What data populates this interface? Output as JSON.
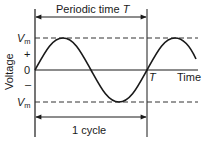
{
  "diagram": {
    "type": "sine-waveform",
    "colors": {
      "stroke": "#1a1a1a",
      "dashed": "#333333",
      "background": "#ffffff"
    },
    "labels": {
      "periodic_time": "Periodic time ",
      "periodic_time_symbol": "T",
      "one_cycle": "1 cycle",
      "vm_top_main": "V",
      "vm_top_sub": "m",
      "vm_bottom_main": "V",
      "vm_bottom_sub": "m",
      "plus": "+",
      "zero": "0",
      "minus": "–",
      "y_axis": "Voltage",
      "x_axis": "Time",
      "t_marker": "T"
    }
  }
}
